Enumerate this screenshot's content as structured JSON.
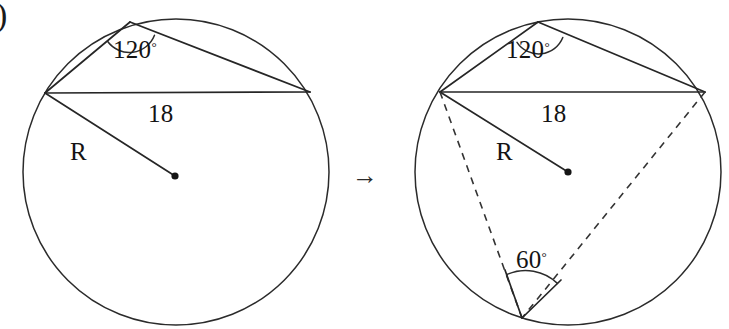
{
  "figure": {
    "corner_label": ")",
    "transition_arrow": "→",
    "background_color": "#ffffff",
    "ink_color": "#262626",
    "diagrams": [
      {
        "id": "left-diagram",
        "name": "circle-with-inscribed-angle",
        "circle": {
          "cx": 176,
          "cy": 172,
          "r": 153
        },
        "center_dot": {
          "cx": 175,
          "cy": 176
        },
        "chord_label": "18",
        "radius_label": "R",
        "angle_label": "120",
        "angle_degree_symbol": "°",
        "points": {
          "chord_left": {
            "x": 45,
            "y": 93
          },
          "chord_right": {
            "x": 310,
            "y": 92
          },
          "apex": {
            "x": 130,
            "y": 22
          }
        },
        "label_positions": {
          "angle": {
            "x": 113,
            "y": 58
          },
          "chord": {
            "x": 148,
            "y": 122
          },
          "radius": {
            "x": 70,
            "y": 160
          }
        }
      },
      {
        "id": "right-diagram",
        "name": "circle-with-inscribed-and-central-angle",
        "circle": {
          "cx": 568,
          "cy": 172,
          "r": 153
        },
        "center_dot": {
          "cx": 568,
          "cy": 172
        },
        "chord_label": "18",
        "radius_label": "R",
        "angle_label": "120",
        "second_angle_label": "60",
        "angle_degree_symbol": "°",
        "points": {
          "chord_left": {
            "x": 440,
            "y": 92
          },
          "chord_right": {
            "x": 705,
            "y": 92
          },
          "apex": {
            "x": 538,
            "y": 22
          },
          "bottom_vertex": {
            "x": 522,
            "y": 318
          }
        },
        "label_positions": {
          "angle": {
            "x": 506,
            "y": 58
          },
          "chord": {
            "x": 541,
            "y": 122
          },
          "radius": {
            "x": 496,
            "y": 160
          },
          "second_angle": {
            "x": 529,
            "y": 268
          }
        }
      }
    ]
  }
}
